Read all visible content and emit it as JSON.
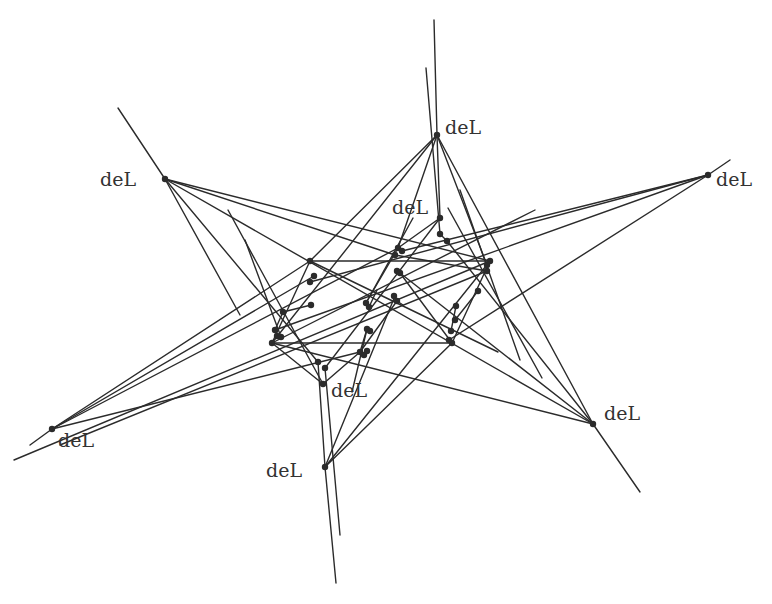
{
  "figure": {
    "type": "geometric-configuration",
    "background": "#ffffff",
    "stroke_color": "#2b2b2b",
    "label_text": "deL",
    "labels": [
      {
        "text": "deL",
        "x": 100,
        "y": 186,
        "anchor_point": [
          165,
          179
        ]
      },
      {
        "text": "deL",
        "x": 445,
        "y": 134,
        "anchor_point": [
          437,
          135
        ]
      },
      {
        "text": "deL",
        "x": 716,
        "y": 186,
        "anchor_point": [
          708,
          175
        ]
      },
      {
        "text": "deL",
        "x": 392,
        "y": 214,
        "anchor_point": [
          440,
          218
        ]
      },
      {
        "text": "deL",
        "x": 331,
        "y": 397,
        "anchor_point": [
          323,
          384
        ]
      },
      {
        "text": "deL",
        "x": 604,
        "y": 420,
        "anchor_point": [
          593,
          424
        ]
      },
      {
        "text": "deL",
        "x": 58,
        "y": 447,
        "anchor_point": [
          52,
          429
        ]
      },
      {
        "text": "deL",
        "x": 266,
        "y": 477,
        "anchor_point": [
          325,
          467
        ]
      }
    ],
    "points": [
      [
        165,
        179
      ],
      [
        437,
        135
      ],
      [
        708,
        175
      ],
      [
        52,
        429
      ],
      [
        593,
        424
      ],
      [
        325,
        467
      ],
      [
        440,
        218
      ],
      [
        440,
        234
      ],
      [
        447,
        241
      ],
      [
        323,
        384
      ],
      [
        318,
        362
      ],
      [
        325,
        368
      ],
      [
        310,
        261
      ],
      [
        490,
        261
      ],
      [
        452,
        343
      ],
      [
        272,
        343
      ],
      [
        398,
        248
      ],
      [
        402,
        251
      ],
      [
        395,
        255
      ],
      [
        487,
        271
      ],
      [
        487,
        265
      ],
      [
        275,
        330
      ],
      [
        277,
        336
      ],
      [
        281,
        337
      ],
      [
        314,
        276
      ],
      [
        310,
        282
      ],
      [
        283,
        312
      ],
      [
        311,
        305
      ],
      [
        366,
        303
      ],
      [
        369,
        307
      ],
      [
        394,
        296
      ],
      [
        397,
        301
      ],
      [
        360,
        352
      ],
      [
        364,
        355
      ],
      [
        367,
        351
      ],
      [
        478,
        291
      ],
      [
        455,
        320
      ],
      [
        451,
        331
      ],
      [
        449,
        340
      ],
      [
        397,
        271
      ],
      [
        400,
        273
      ],
      [
        367,
        329
      ],
      [
        370,
        331
      ],
      [
        456,
        306
      ]
    ],
    "lines": [
      [
        118,
        108,
        165,
        179
      ],
      [
        165,
        179,
        240,
        315
      ],
      [
        165,
        179,
        318,
        362
      ],
      [
        165,
        179,
        395,
        255
      ],
      [
        165,
        179,
        490,
        261
      ],
      [
        434,
        20,
        437,
        135
      ],
      [
        437,
        135,
        440,
        218
      ],
      [
        426,
        68,
        440,
        234
      ],
      [
        437,
        135,
        310,
        261
      ],
      [
        437,
        135,
        272,
        343
      ],
      [
        437,
        135,
        398,
        248
      ],
      [
        437,
        135,
        487,
        265
      ],
      [
        730,
        160,
        708,
        175
      ],
      [
        708,
        175,
        402,
        251
      ],
      [
        708,
        175,
        449,
        340
      ],
      [
        708,
        175,
        310,
        282
      ],
      [
        708,
        175,
        275,
        330
      ],
      [
        30,
        445,
        52,
        429
      ],
      [
        52,
        429,
        310,
        261
      ],
      [
        52,
        429,
        314,
        276
      ],
      [
        52,
        429,
        360,
        352
      ],
      [
        52,
        429,
        398,
        248
      ],
      [
        640,
        492,
        593,
        424
      ],
      [
        593,
        424,
        165,
        179
      ],
      [
        593,
        424,
        447,
        241
      ],
      [
        593,
        424,
        437,
        135
      ],
      [
        593,
        424,
        400,
        273
      ],
      [
        593,
        424,
        272,
        343
      ],
      [
        336,
        583,
        325,
        467
      ],
      [
        325,
        467,
        318,
        362
      ],
      [
        340,
        535,
        325,
        368
      ],
      [
        325,
        467,
        452,
        343
      ],
      [
        325,
        467,
        490,
        261
      ],
      [
        325,
        467,
        395,
        296
      ],
      [
        310,
        261,
        490,
        261
      ],
      [
        272,
        343,
        452,
        343
      ],
      [
        310,
        261,
        272,
        343
      ],
      [
        490,
        261,
        452,
        343
      ],
      [
        440,
        218,
        398,
        248
      ],
      [
        440,
        218,
        325,
        368
      ],
      [
        440,
        234,
        447,
        241
      ],
      [
        245,
        240,
        281,
        337
      ],
      [
        228,
        210,
        323,
        384
      ],
      [
        460,
        190,
        520,
        360
      ],
      [
        448,
        208,
        542,
        378
      ],
      [
        323,
        384,
        272,
        343
      ],
      [
        323,
        384,
        360,
        352
      ],
      [
        360,
        352,
        367,
        329
      ],
      [
        360,
        352,
        397,
        301
      ],
      [
        366,
        303,
        413,
        218
      ],
      [
        367,
        329,
        352,
        392
      ],
      [
        397,
        301,
        403,
        305
      ],
      [
        369,
        307,
        377,
        290
      ],
      [
        311,
        305,
        283,
        312
      ],
      [
        283,
        312,
        275,
        330
      ],
      [
        478,
        291,
        455,
        320
      ],
      [
        456,
        306,
        451,
        331
      ],
      [
        398,
        248,
        366,
        303
      ],
      [
        400,
        273,
        452,
        343
      ],
      [
        395,
        255,
        487,
        271
      ],
      [
        14,
        460,
        490,
        261
      ],
      [
        60,
        445,
        487,
        271
      ],
      [
        310,
        261,
        498,
        352
      ],
      [
        272,
        343,
        535,
        210
      ]
    ]
  }
}
